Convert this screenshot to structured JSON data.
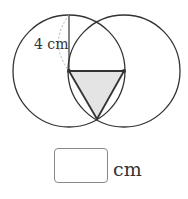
{
  "figure": {
    "radius_label": "4 cm",
    "colors": {
      "stroke": "#333333",
      "shaded_fill": "#e4e4e4",
      "dashed_arc": "#b0b0b0"
    }
  },
  "answer": {
    "value": "",
    "unit": "cm"
  }
}
